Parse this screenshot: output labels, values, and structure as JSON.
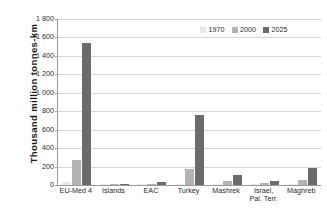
{
  "chart_data": {
    "type": "bar",
    "title": "",
    "subtitle": "",
    "xlabel": "",
    "ylabel": "Thousand million tonnes-km",
    "ylim": [
      0,
      1800
    ],
    "ytick_values": [
      0,
      200,
      400,
      600,
      800,
      1000,
      1200,
      1400,
      1600,
      1800
    ],
    "ytick_labels": [
      "0",
      "200",
      "400",
      "600",
      "800",
      "1 000",
      "1 200",
      "1 400",
      "1 600",
      "1 800"
    ],
    "grid": "horizontal",
    "legend_position": "top-right",
    "categories": [
      "EU-Med 4",
      "Islands",
      "EAC",
      "Turkey",
      "Mashrek",
      "Israel,\nPal. Terr.",
      "Maghreb"
    ],
    "series": [
      {
        "name": "1970",
        "color": "#e9e9e9",
        "values": [
          28,
          1,
          2,
          10,
          7,
          4,
          10
        ]
      },
      {
        "name": "2000",
        "color": "#b3b3b3",
        "values": [
          270,
          3,
          8,
          170,
          45,
          22,
          52
        ]
      },
      {
        "name": "2025",
        "color": "#6b6b6b",
        "values": [
          1540,
          8,
          35,
          755,
          110,
          48,
          180
        ]
      }
    ]
  },
  "legend": {
    "items": [
      {
        "label": "1970",
        "color": "#e9e9e9"
      },
      {
        "label": "2000",
        "color": "#b3b3b3"
      },
      {
        "label": "2025",
        "color": "#6b6b6b"
      }
    ]
  },
  "axes": {
    "y_title": "Thousand million tonnes-km"
  }
}
